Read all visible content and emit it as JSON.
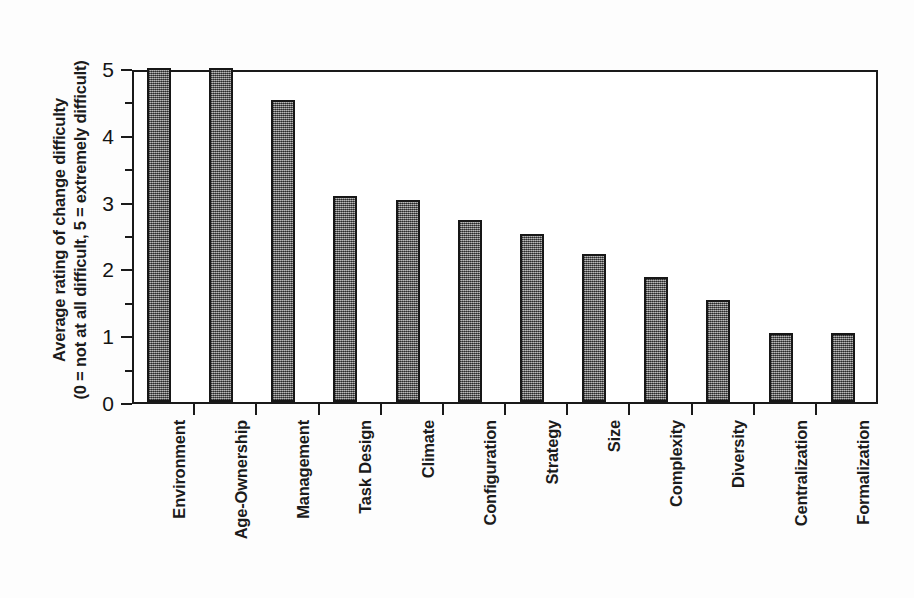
{
  "chart_data": {
    "type": "bar",
    "title": "",
    "subtitle": "",
    "xlabel": "",
    "ylabel_line1": "Average rating of change difficulty",
    "ylabel_line2": "(0 = not at all difficult, 5 = extremely difficult)",
    "categories": [
      "Environment",
      "Age-Ownership",
      "Management",
      "Task Design",
      "Climate",
      "Configuration",
      "Strategy",
      "Size",
      "Complexity",
      "Diversity",
      "Centralization",
      "Formalization"
    ],
    "values": [
      5.0,
      5.0,
      4.52,
      3.09,
      3.03,
      2.73,
      2.51,
      2.22,
      1.87,
      1.53,
      1.03,
      1.03
    ],
    "ylim": [
      0,
      5
    ],
    "ytick_labels": [
      "0",
      "1",
      "2",
      "3",
      "4",
      "5"
    ],
    "ytick_values": [
      0,
      1,
      2,
      3,
      4,
      5
    ],
    "yminor_values": [
      0.5,
      1.5,
      2.5,
      3.5,
      4.5
    ],
    "grid": false,
    "legend": null,
    "legend_position": "none",
    "bar_fill_color": "#6a6a6a",
    "bar_border_color": "#171717",
    "axis_color": "#1a1a1a",
    "background_color": "#ffffff"
  },
  "figure": {
    "axis_title_y": "Average rating of change difficulty (0 = not at all difficult, 5 = extremely difficult)"
  }
}
